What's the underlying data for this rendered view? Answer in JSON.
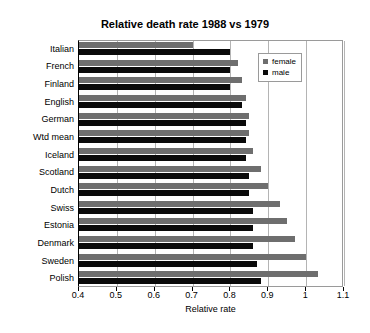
{
  "chart_data": {
    "type": "bar",
    "orientation": "horizontal",
    "title": "Relative death rate 1988 vs 1979",
    "xlabel": "Relative rate",
    "ylabel": "",
    "xlim": [
      0.4,
      1.1
    ],
    "xticks": [
      "0.4",
      "0.5",
      "0.6",
      "0.7",
      "0.8",
      "0.9",
      "1",
      "1.1"
    ],
    "grid": true,
    "legend_position": "top-right",
    "categories": [
      "Italian",
      "French",
      "Finland",
      "English",
      "German",
      "Wtd mean",
      "Iceland",
      "Scotland",
      "Dutch",
      "Swiss",
      "Estonia",
      "Denmark",
      "Sweden",
      "Polish"
    ],
    "series": [
      {
        "name": "female",
        "color": "#6e6e6e",
        "values": [
          0.7,
          0.82,
          0.83,
          0.84,
          0.85,
          0.85,
          0.86,
          0.88,
          0.9,
          0.93,
          0.95,
          0.97,
          1.0,
          1.03
        ]
      },
      {
        "name": "male",
        "color": "#0a0a0a",
        "values": [
          0.8,
          0.8,
          0.8,
          0.83,
          0.84,
          0.84,
          0.84,
          0.85,
          0.85,
          0.86,
          0.86,
          0.86,
          0.87,
          0.88
        ]
      }
    ]
  }
}
